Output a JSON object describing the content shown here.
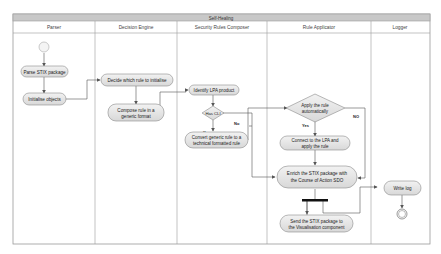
{
  "diagram": {
    "title": "Self-Healing",
    "lanes": [
      {
        "name": "Parser"
      },
      {
        "name": "Decision Engine"
      },
      {
        "name": "Security Rules Composer"
      },
      {
        "name": "Rule Applicator"
      },
      {
        "name": "Logger"
      }
    ],
    "nodes": {
      "parse": {
        "line1": "Parse STIX package",
        "line2": ""
      },
      "init": {
        "line1": "Initialise objects",
        "line2": ""
      },
      "decide": {
        "line1": "Decide which rule to initialise",
        "line2": ""
      },
      "compose": {
        "line1": "Compose rule in a",
        "line2": "generic format"
      },
      "identify": {
        "line1": "Identify LPA product",
        "line2": ""
      },
      "hascli": {
        "line1": "Has CLI",
        "line2": ""
      },
      "convert": {
        "line1": "Convert generic rule to a",
        "line2": "technical formatted rule"
      },
      "applyauto": {
        "line1": "Apply the rule",
        "line2": "automatically"
      },
      "connect": {
        "line1": "Connect to the LPA and",
        "line2": "apply the rule"
      },
      "enrich": {
        "line1": "Enrich the STIX package with",
        "line2": "the Course of Action SDO"
      },
      "send": {
        "line1": "Send the STIX package to",
        "line2": "the Visualisation component"
      },
      "writelog": {
        "line1": "Write log",
        "line2": ""
      }
    },
    "labels": {
      "has_cli_yes": "Yes",
      "has_cli_no": "No",
      "apply_yes": "Yes",
      "apply_no": "NO"
    },
    "colors": {
      "title_bar": "#c8c8c8",
      "node_fill": "#e6e6e6",
      "node_stroke": "#8a8a8a",
      "lane_border": "#9a9a9a",
      "edge": "#555555"
    }
  }
}
